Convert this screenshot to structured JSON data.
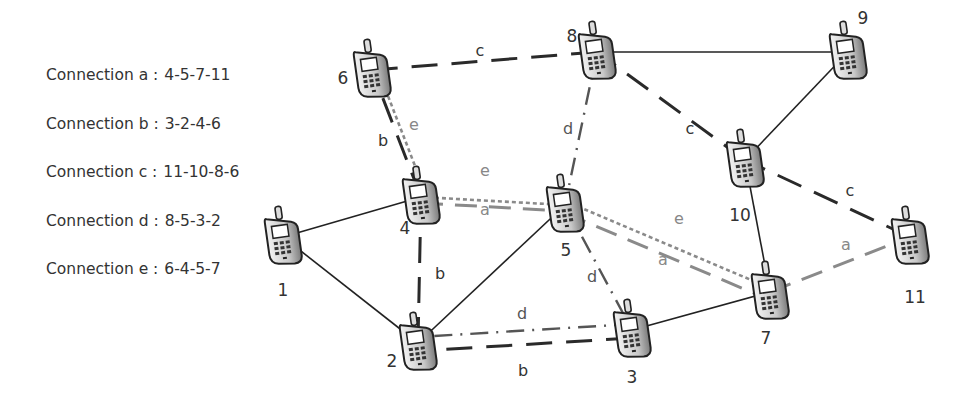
{
  "legend": {
    "items": [
      {
        "label": "Connection a :",
        "route": "4-5-7-11"
      },
      {
        "label": "Connection b :",
        "route": "3-2-4-6"
      },
      {
        "label": "Connection c :",
        "route": "11-10-8-6"
      },
      {
        "label": "Connection d :",
        "route": "8-5-3-2"
      },
      {
        "label": "Connection e :",
        "route": "6-4-5-7"
      }
    ]
  },
  "nodes": [
    {
      "id": "1",
      "label": "1",
      "x": 283,
      "y": 237,
      "lx": 283,
      "ly": 296
    },
    {
      "id": "2",
      "label": "2",
      "x": 418,
      "y": 343,
      "lx": 392,
      "ly": 367
    },
    {
      "id": "3",
      "label": "3",
      "x": 632,
      "y": 330,
      "lx": 632,
      "ly": 383
    },
    {
      "id": "4",
      "label": "4",
      "x": 421,
      "y": 197,
      "lx": 405,
      "ly": 234
    },
    {
      "id": "5",
      "label": "5",
      "x": 565,
      "y": 205,
      "lx": 566,
      "ly": 256
    },
    {
      "id": "6",
      "label": "6",
      "x": 372,
      "y": 70,
      "lx": 343,
      "ly": 84
    },
    {
      "id": "7",
      "label": "7",
      "x": 770,
      "y": 292,
      "lx": 766,
      "ly": 344
    },
    {
      "id": "8",
      "label": "8",
      "x": 597,
      "y": 52,
      "lx": 572,
      "ly": 42
    },
    {
      "id": "9",
      "label": "9",
      "x": 848,
      "y": 52,
      "lx": 863,
      "ly": 24
    },
    {
      "id": "10",
      "label": "10",
      "x": 745,
      "y": 160,
      "lx": 740,
      "ly": 221
    },
    {
      "id": "11",
      "label": "11",
      "x": 910,
      "y": 237,
      "lx": 915,
      "ly": 303
    }
  ],
  "links": [
    [
      "1",
      "4"
    ],
    [
      "1",
      "2"
    ],
    [
      "2",
      "5"
    ],
    [
      "3",
      "7"
    ],
    [
      "7",
      "10"
    ],
    [
      "10",
      "9"
    ],
    [
      "8",
      "9"
    ]
  ],
  "connections": {
    "a": {
      "name": "a",
      "path": [
        "4",
        "5",
        "7",
        "11"
      ],
      "color": "#8a8a8a",
      "style": "long-dash-gray"
    },
    "b": {
      "name": "b",
      "path": [
        "3",
        "2",
        "4",
        "6"
      ],
      "color": "#2a2a2a",
      "style": "long-dash-black"
    },
    "c": {
      "name": "c",
      "path": [
        "11",
        "10",
        "8",
        "6"
      ],
      "color": "#2a2a2a",
      "style": "long-dash-black"
    },
    "d": {
      "name": "d",
      "path": [
        "8",
        "5",
        "3",
        "2"
      ],
      "color": "#555555",
      "style": "dash-dot"
    },
    "e": {
      "name": "e",
      "path": [
        "6",
        "4",
        "5",
        "7"
      ],
      "color": "#8a8a8a",
      "style": "dotted-gray"
    }
  },
  "edge_labels": [
    {
      "text": "c",
      "x": 480,
      "y": 56,
      "color": "#333"
    },
    {
      "text": "c",
      "x": 690,
      "y": 134,
      "color": "#333"
    },
    {
      "text": "c",
      "x": 850,
      "y": 196,
      "color": "#333"
    },
    {
      "text": "b",
      "x": 383,
      "y": 146,
      "color": "#333"
    },
    {
      "text": "b",
      "x": 440,
      "y": 279,
      "color": "#333"
    },
    {
      "text": "b",
      "x": 523,
      "y": 376,
      "color": "#333"
    },
    {
      "text": "d",
      "x": 568,
      "y": 134,
      "color": "#555"
    },
    {
      "text": "d",
      "x": 592,
      "y": 282,
      "color": "#555"
    },
    {
      "text": "d",
      "x": 522,
      "y": 319,
      "color": "#555"
    },
    {
      "text": "e",
      "x": 414,
      "y": 130,
      "color": "#888"
    },
    {
      "text": "e",
      "x": 485,
      "y": 176,
      "color": "#888"
    },
    {
      "text": "e",
      "x": 679,
      "y": 224,
      "color": "#888"
    },
    {
      "text": "a",
      "x": 485,
      "y": 215,
      "color": "#888"
    },
    {
      "text": "a",
      "x": 663,
      "y": 265,
      "color": "#888"
    },
    {
      "text": "a",
      "x": 846,
      "y": 250,
      "color": "#888"
    }
  ]
}
